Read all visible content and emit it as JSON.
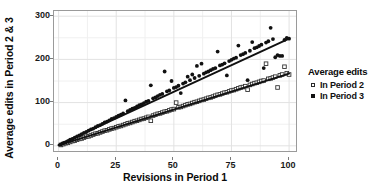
{
  "chart_data": {
    "type": "scatter",
    "title": "",
    "xlabel": "Revisions in Period 1",
    "ylabel": "Average edits in Period 2 & 3",
    "xlim": [
      -2,
      103
    ],
    "ylim": [
      -12,
      312
    ],
    "xticks": [
      0,
      25,
      50,
      75,
      100
    ],
    "yticks": [
      0,
      100,
      200,
      300
    ],
    "xtick_labels": [
      "0",
      "25",
      "50",
      "75",
      "100"
    ],
    "ytick_labels": [
      "0",
      "100",
      "200",
      "300"
    ],
    "grid": true,
    "grid_minor": true,
    "legend_position": "right",
    "legend_title": "Average edits",
    "series": [
      {
        "name": "In Period 2",
        "marker": "open-square",
        "color": "#333333",
        "trend_line": {
          "intercept": 1.0,
          "slope": 1.66
        },
        "points": [
          [
            1,
            2
          ],
          [
            2,
            4
          ],
          [
            3,
            6
          ],
          [
            4,
            7
          ],
          [
            5,
            9
          ],
          [
            6,
            11
          ],
          [
            7,
            12
          ],
          [
            8,
            14
          ],
          [
            9,
            16
          ],
          [
            10,
            17
          ],
          [
            11,
            19
          ],
          [
            12,
            21
          ],
          [
            13,
            22
          ],
          [
            14,
            24
          ],
          [
            15,
            26
          ],
          [
            16,
            28
          ],
          [
            17,
            29
          ],
          [
            18,
            31
          ],
          [
            19,
            33
          ],
          [
            20,
            35
          ],
          [
            21,
            36
          ],
          [
            22,
            38
          ],
          [
            23,
            40
          ],
          [
            24,
            41
          ],
          [
            25,
            43
          ],
          [
            26,
            45
          ],
          [
            27,
            46
          ],
          [
            28,
            48
          ],
          [
            29,
            50
          ],
          [
            30,
            52
          ],
          [
            31,
            53
          ],
          [
            32,
            55
          ],
          [
            33,
            57
          ],
          [
            34,
            58
          ],
          [
            35,
            60
          ],
          [
            36,
            62
          ],
          [
            37,
            63
          ],
          [
            38,
            65
          ],
          [
            39,
            67
          ],
          [
            40,
            58
          ],
          [
            41,
            70
          ],
          [
            42,
            72
          ],
          [
            43,
            74
          ],
          [
            44,
            75
          ],
          [
            45,
            77
          ],
          [
            46,
            79
          ],
          [
            47,
            80
          ],
          [
            48,
            82
          ],
          [
            49,
            84
          ],
          [
            50,
            85
          ],
          [
            51,
            100
          ],
          [
            52,
            89
          ],
          [
            53,
            90
          ],
          [
            54,
            92
          ],
          [
            55,
            94
          ],
          [
            56,
            96
          ],
          [
            57,
            97
          ],
          [
            58,
            99
          ],
          [
            59,
            101
          ],
          [
            60,
            102
          ],
          [
            61,
            104
          ],
          [
            62,
            106
          ],
          [
            63,
            107
          ],
          [
            64,
            109
          ],
          [
            65,
            111
          ],
          [
            66,
            112
          ],
          [
            67,
            114
          ],
          [
            68,
            116
          ],
          [
            69,
            118
          ],
          [
            70,
            119
          ],
          [
            71,
            121
          ],
          [
            72,
            123
          ],
          [
            73,
            124
          ],
          [
            74,
            126
          ],
          [
            75,
            128
          ],
          [
            76,
            129
          ],
          [
            77,
            131
          ],
          [
            78,
            133
          ],
          [
            79,
            135
          ],
          [
            80,
            136
          ],
          [
            81,
            138
          ],
          [
            82,
            130
          ],
          [
            83,
            141
          ],
          [
            84,
            143
          ],
          [
            85,
            145
          ],
          [
            86,
            146
          ],
          [
            87,
            148
          ],
          [
            88,
            150
          ],
          [
            89,
            151
          ],
          [
            90,
            190
          ],
          [
            91,
            155
          ],
          [
            92,
            156
          ],
          [
            93,
            158
          ],
          [
            94,
            160
          ],
          [
            95,
            135
          ],
          [
            96,
            163
          ],
          [
            97,
            165
          ],
          [
            98,
            183
          ],
          [
            99,
            168
          ],
          [
            100,
            165
          ]
        ]
      },
      {
        "name": "In Period 3",
        "marker": "filled-circle",
        "color": "#111111",
        "trend_line": {
          "intercept": 2.0,
          "slope": 2.46
        },
        "points": [
          [
            1,
            3
          ],
          [
            2,
            6
          ],
          [
            3,
            8
          ],
          [
            4,
            11
          ],
          [
            5,
            14
          ],
          [
            6,
            16
          ],
          [
            7,
            19
          ],
          [
            8,
            22
          ],
          [
            9,
            24
          ],
          [
            10,
            27
          ],
          [
            11,
            30
          ],
          [
            12,
            32
          ],
          [
            13,
            35
          ],
          [
            14,
            38
          ],
          [
            15,
            40
          ],
          [
            16,
            43
          ],
          [
            17,
            46
          ],
          [
            18,
            48
          ],
          [
            19,
            51
          ],
          [
            20,
            54
          ],
          [
            21,
            56
          ],
          [
            22,
            59
          ],
          [
            23,
            62
          ],
          [
            24,
            64
          ],
          [
            25,
            67
          ],
          [
            26,
            70
          ],
          [
            27,
            72
          ],
          [
            28,
            75
          ],
          [
            29,
            105
          ],
          [
            30,
            80
          ],
          [
            31,
            83
          ],
          [
            32,
            86
          ],
          [
            33,
            88
          ],
          [
            34,
            91
          ],
          [
            35,
            94
          ],
          [
            36,
            96
          ],
          [
            37,
            99
          ],
          [
            38,
            102
          ],
          [
            39,
            104
          ],
          [
            40,
            140
          ],
          [
            41,
            110
          ],
          [
            42,
            112
          ],
          [
            43,
            115
          ],
          [
            44,
            118
          ],
          [
            45,
            120
          ],
          [
            46,
            172
          ],
          [
            47,
            126
          ],
          [
            48,
            128
          ],
          [
            49,
            150
          ],
          [
            50,
            134
          ],
          [
            51,
            136
          ],
          [
            52,
            139
          ],
          [
            53,
            122
          ],
          [
            54,
            144
          ],
          [
            55,
            147
          ],
          [
            56,
            160
          ],
          [
            57,
            152
          ],
          [
            58,
            165
          ],
          [
            59,
            157
          ],
          [
            60,
            185
          ],
          [
            61,
            162
          ],
          [
            62,
            190
          ],
          [
            63,
            167
          ],
          [
            64,
            170
          ],
          [
            65,
            172
          ],
          [
            66,
            175
          ],
          [
            67,
            178
          ],
          [
            68,
            180
          ],
          [
            69,
            218
          ],
          [
            70,
            186
          ],
          [
            71,
            188
          ],
          [
            72,
            191
          ],
          [
            73,
            163
          ],
          [
            74,
            196
          ],
          [
            75,
            199
          ],
          [
            76,
            202
          ],
          [
            77,
            204
          ],
          [
            78,
            232
          ],
          [
            79,
            210
          ],
          [
            80,
            212
          ],
          [
            81,
            215
          ],
          [
            82,
            152
          ],
          [
            83,
            220
          ],
          [
            84,
            240
          ],
          [
            85,
            226
          ],
          [
            86,
            228
          ],
          [
            87,
            231
          ],
          [
            88,
            234
          ],
          [
            89,
            180
          ],
          [
            90,
            239
          ],
          [
            91,
            242
          ],
          [
            92,
            273
          ],
          [
            93,
            247
          ],
          [
            94,
            205
          ],
          [
            95,
            210
          ],
          [
            96,
            208
          ],
          [
            97,
            208
          ],
          [
            98,
            245
          ],
          [
            99,
            250
          ],
          [
            100,
            248
          ]
        ]
      }
    ]
  }
}
